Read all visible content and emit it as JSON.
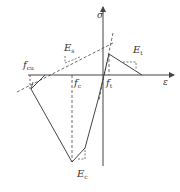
{
  "diagram": {
    "type": "stress-strain constitutive curve",
    "axes": {
      "y_label": "σ",
      "x_label": "ε"
    },
    "labels": {
      "E_s": {
        "main": "E",
        "sub": "s"
      },
      "E_t": {
        "main": "E",
        "sub": "t"
      },
      "E_c": {
        "main": "E",
        "sub": "c"
      },
      "f_cu": {
        "main": "f",
        "sub": "cu"
      },
      "f_c": {
        "main": "f",
        "sub": "c"
      },
      "f_t": {
        "main": "f",
        "sub": "t"
      }
    },
    "colors": {
      "line": "#444444",
      "background": "#ffffff"
    }
  }
}
